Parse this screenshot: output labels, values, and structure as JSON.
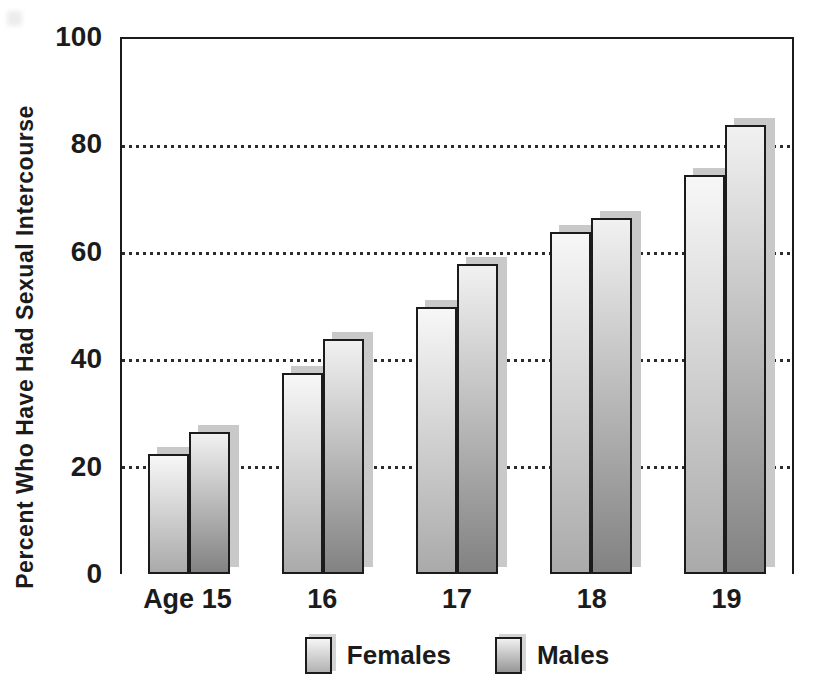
{
  "figure": {
    "background": "#ffffff",
    "axis_color": "#1b1b1b",
    "grid_color": "#2b2b2b",
    "text_color": "#1b1b1b",
    "shadow_color": "#c9c9c9"
  },
  "chart_data": {
    "type": "bar",
    "title": "",
    "categories": [
      "Age 15",
      "16",
      "17",
      "18",
      "19"
    ],
    "series": [
      {
        "name": "Females",
        "values": [
          22.5,
          37.5,
          50,
          64,
          74.5
        ],
        "color_top": "#f7f7f7",
        "color_bottom": "#aaaaaa"
      },
      {
        "name": "Males",
        "values": [
          26.5,
          44,
          58,
          66.5,
          84
        ],
        "color_top": "#f1f1f1",
        "color_bottom": "#828282"
      }
    ],
    "xlabel": "",
    "ylabel": "Percent Who Have Had Sexual Intercourse",
    "ylim": [
      0,
      100
    ],
    "yticks": [
      100,
      80,
      60,
      40,
      20,
      0
    ],
    "grid": "horizontal-dotted",
    "gridline_values": [
      80,
      60,
      40,
      20
    ],
    "legend_position": "bottom"
  },
  "legend": {
    "items": [
      {
        "label": "Females",
        "swatch_top": "#f5f5f5",
        "swatch_bottom": "#b2b2b2"
      },
      {
        "label": "Males",
        "swatch_top": "#f0f0f0",
        "swatch_bottom": "#969696"
      }
    ]
  }
}
